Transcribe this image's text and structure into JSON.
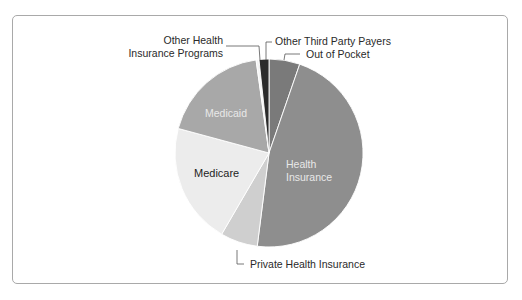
{
  "chart_data": {
    "type": "pie",
    "title": "",
    "start_angle_deg": 0,
    "direction": "clockwise",
    "slices": [
      {
        "label": "Out of Pocket",
        "value": 5.3,
        "color": "#7a7a7a",
        "label_position": "outside"
      },
      {
        "label": "Health Insurance",
        "value": 46.7,
        "color": "#8e8e8e",
        "label_position": "inside"
      },
      {
        "label": "Private Health Insurance",
        "value": 6.4,
        "color": "#cfcfcf",
        "label_position": "outside"
      },
      {
        "label": "Medicare",
        "value": 20.8,
        "color": "#ececec",
        "label_position": "inside"
      },
      {
        "label": "Medicaid",
        "value": 18.6,
        "color": "#a8a8a8",
        "label_position": "inside"
      },
      {
        "label": "Other Health Insurance Programs",
        "value": 0.5,
        "color": "#f4f4f4",
        "label_position": "outside"
      },
      {
        "label": "Other Third Party Payers",
        "value": 1.7,
        "color": "#2b2b2b",
        "label_position": "outside"
      }
    ],
    "legend": "none",
    "grid": false
  },
  "labels": {
    "out_of_pocket": "Out of Pocket",
    "health_insurance_line1": "Health",
    "health_insurance_line2": "Insurance",
    "private_health_insurance": "Private Health Insurance",
    "medicare": "Medicare",
    "medicaid": "Medicaid",
    "other_health_programs_line1": "Other Health",
    "other_health_programs_line2": "Insurance Programs",
    "other_third_party": "Other Third Party Payers"
  }
}
